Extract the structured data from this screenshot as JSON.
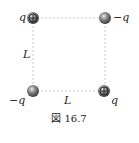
{
  "figure": {
    "caption": "図 16.7",
    "side_label_vertical": "L",
    "side_label_horizontal": "L",
    "charges": [
      {
        "position": "top-left",
        "label": "q",
        "sign": "+"
      },
      {
        "position": "top-right",
        "label": "−q",
        "sign": "−"
      },
      {
        "position": "bottom-left",
        "label": "−q",
        "sign": "−"
      },
      {
        "position": "bottom-right",
        "label": "q",
        "sign": "+"
      }
    ],
    "colors": {
      "sphere": "#6e6e6e",
      "edge": "#c8c8c8",
      "text": "#222222"
    }
  }
}
